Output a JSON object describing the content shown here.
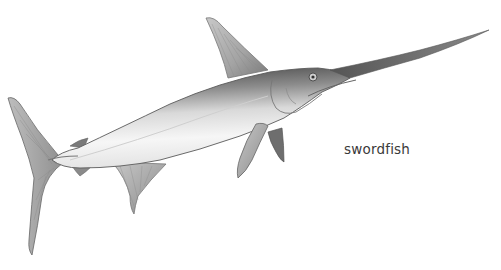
{
  "illustration": {
    "subject": "swordfish",
    "style": "pencil-sketch",
    "colors": {
      "background": "#ffffff",
      "body_dark": "#4a4a4a",
      "body_mid": "#9a9a9a",
      "body_light": "#f2f2f2",
      "outline": "#555555",
      "fin": "#b5b5b5"
    }
  },
  "label": {
    "text": "swordfish"
  }
}
